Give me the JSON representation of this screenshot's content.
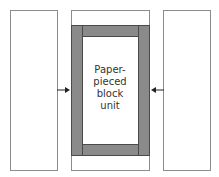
{
  "diagram": {
    "center_label": [
      "Paper-",
      "pieced",
      "block",
      "unit"
    ],
    "colors": {
      "panel_fill": "#ffffff",
      "panel_border": "#8c8c8c",
      "strip_fill": "#8a8a8a",
      "strip_border": "#4a4a4a",
      "arrow": "#222222"
    },
    "arrows": [
      {
        "direction": "right",
        "from": "left-panel",
        "to": "center-unit"
      },
      {
        "direction": "left",
        "from": "right-panel",
        "to": "center-unit"
      }
    ]
  }
}
